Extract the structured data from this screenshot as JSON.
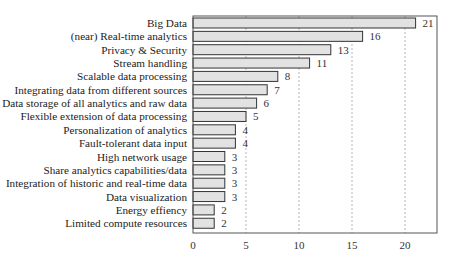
{
  "chart_data": {
    "type": "bar",
    "orientation": "horizontal",
    "title": "",
    "xlabel": "",
    "ylabel": "",
    "categories": [
      "Big Data",
      "(near) Real-time analytics",
      "Privacy & Security",
      "Stream handling",
      "Scalable data processing",
      "Integrating data from different sources",
      "Data storage of all analytics and raw data",
      "Flexible extension of data processing",
      "Personalization of analytics",
      "Fault-tolerant data input",
      "High network usage",
      "Share analytics capabilities/data",
      "Integration of historic and real-time data",
      "Data visualization",
      "Energy effiency",
      "Limited compute resources"
    ],
    "values": [
      21,
      16,
      13,
      11,
      8,
      7,
      6,
      5,
      4,
      4,
      3,
      3,
      3,
      3,
      2,
      2
    ],
    "xticks": [
      0,
      5,
      10,
      15,
      20
    ],
    "xlim": [
      0,
      23
    ],
    "grid": {
      "x": true,
      "style": "dashed"
    },
    "data_labels": true,
    "legend": null,
    "colors": {
      "bar_fill": "#e2e2e2",
      "bar_edge": "#333333",
      "grid": "#999999",
      "frame": "#555555"
    }
  }
}
